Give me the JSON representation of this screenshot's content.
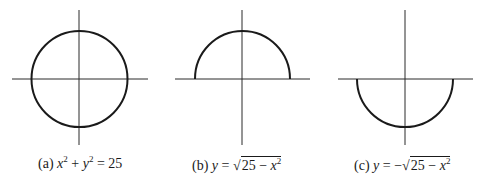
{
  "figure": {
    "panels": [
      {
        "id": "a",
        "tag": "(a)",
        "equation": "x^2 + y^2 = 25",
        "curve": "full circle",
        "caption_parts": {
          "v1": "x",
          "e1": "2",
          "op": " + ",
          "v2": "y",
          "e2": "2",
          "rhs": " = 25"
        }
      },
      {
        "id": "b",
        "tag": "(b)",
        "equation": "y = sqrt(25 - x^2)",
        "curve": "upper semicircle",
        "caption_parts": {
          "lhs": "y",
          "eq": " = ",
          "sign": "",
          "radicand_num": "25 − ",
          "var": "x",
          "exp": "2"
        }
      },
      {
        "id": "c",
        "tag": "(c)",
        "equation": "y = -sqrt(25 - x^2)",
        "curve": "lower semicircle",
        "caption_parts": {
          "lhs": "y",
          "eq": " = ",
          "sign": "−",
          "radicand_num": "25 − ",
          "var": "x",
          "exp": "2"
        }
      }
    ],
    "colors": {
      "stroke": "#1a1a1a",
      "background": "#ffffff"
    }
  }
}
